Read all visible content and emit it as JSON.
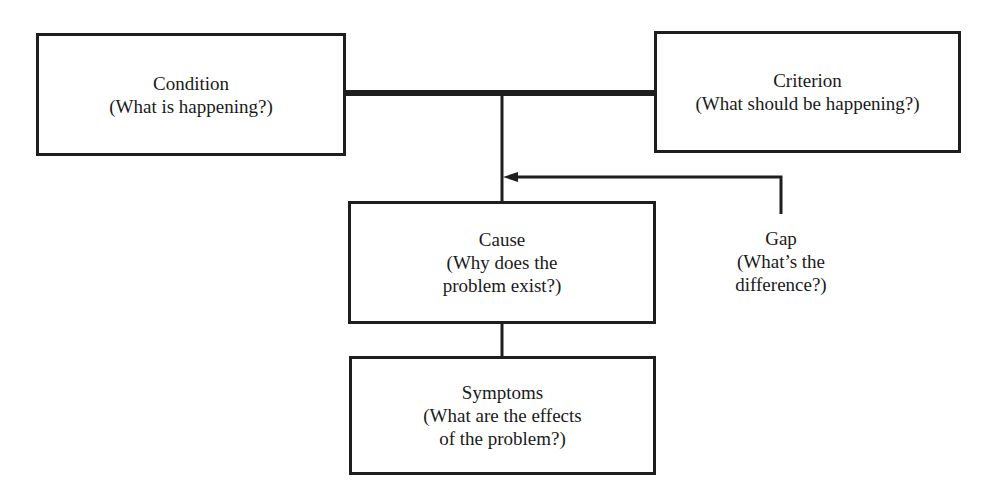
{
  "diagram": {
    "type": "problem-analysis-flow",
    "nodes": {
      "condition": {
        "title": "Condition",
        "question_lines": [
          "(What is happening?)"
        ]
      },
      "criterion": {
        "title": "Criterion",
        "question_lines": [
          "(What should be happening?)"
        ]
      },
      "cause": {
        "title": "Cause",
        "question_lines": [
          "(Why does the",
          "problem exist?)"
        ]
      },
      "symptoms": {
        "title": "Symptoms",
        "question_lines": [
          "(What are the effects",
          "of the problem?)"
        ]
      },
      "gap": {
        "title": "Gap",
        "question_lines": [
          "(What’s the",
          "difference?)"
        ]
      }
    },
    "edges": [
      {
        "from": "condition",
        "to": "criterion",
        "style": "thick-line"
      },
      {
        "from": "condition-criterion-bar",
        "to": "cause",
        "style": "line"
      },
      {
        "from": "gap",
        "to": "cause-trunk",
        "style": "arrow"
      },
      {
        "from": "cause",
        "to": "symptoms",
        "style": "line"
      }
    ],
    "colors": {
      "stroke": "#1e1e1e",
      "background": "#ffffff",
      "text": "#1a1a1a"
    }
  }
}
